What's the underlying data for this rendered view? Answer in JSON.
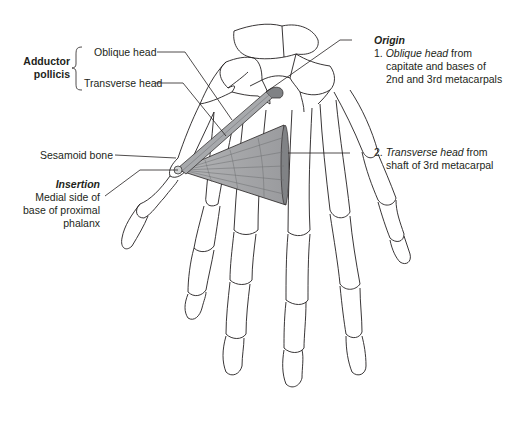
{
  "muscle": {
    "name_line1": "Adductor",
    "name_line2": "pollicis",
    "fill_color": "#a7a9ac",
    "dark_color": "#808285"
  },
  "labels": {
    "oblique_head": "Oblique head",
    "transverse_head": "Transverse head",
    "sesamoid_bone": "Sesamoid bone"
  },
  "insertion": {
    "title": "Insertion",
    "lines": [
      "Medial side of",
      "base of proximal",
      "phalanx"
    ]
  },
  "origin": {
    "title": "Origin",
    "item1": {
      "num": "1.",
      "italic": "Oblique head",
      "rest": " from",
      "line2": "capitate and bases of",
      "line3": "2nd and 3rd metacarpals"
    },
    "item2": {
      "num": "2.",
      "italic": "Transverse head",
      "rest": " from",
      "line2": "shaft of 3rd metacarpal"
    }
  }
}
